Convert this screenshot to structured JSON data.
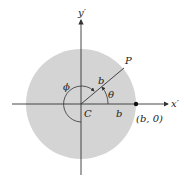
{
  "diagram": {
    "type": "polar-coordinates-circle",
    "colors": {
      "disk_fill": "#d4d4d4",
      "axis": "#333333",
      "text": "#222222",
      "background": "#ffffff"
    },
    "center": {
      "x": 81,
      "y": 104
    },
    "disk_radius": 55,
    "axes": {
      "x_label": "x′",
      "y_label": "y′"
    },
    "labels": {
      "center": "C",
      "point": "P",
      "radius_on_ray": "b",
      "radius_on_axis": "b",
      "theta": "θ",
      "phi": "ϕ",
      "boundary_point": "(b, 0)"
    },
    "angles": {
      "theta_deg": 37,
      "ray_length": 56
    }
  }
}
